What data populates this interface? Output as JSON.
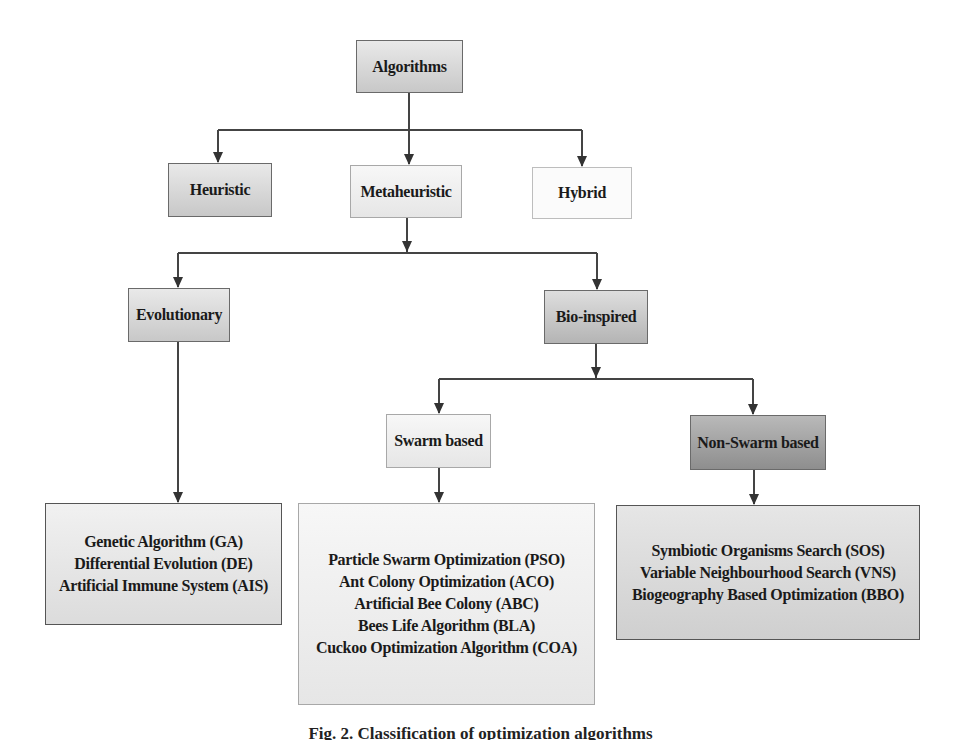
{
  "diagram": {
    "root": {
      "label": "Algorithms"
    },
    "level1": [
      {
        "label": "Heuristic"
      },
      {
        "label": "Metaheuristic"
      },
      {
        "label": "Hybrid"
      }
    ],
    "level2": [
      {
        "label": "Evolutionary"
      },
      {
        "label": "Bio-inspired"
      }
    ],
    "level3": [
      {
        "label": "Swarm based"
      },
      {
        "label": "Non-Swarm based"
      }
    ],
    "leaves": {
      "evolutionary": [
        "Genetic Algorithm (GA)",
        "Differential Evolution (DE)",
        "Artificial Immune System (AIS)"
      ],
      "swarm": [
        "Particle Swarm Optimization (PSO)",
        "Ant Colony Optimization (ACO)",
        "Artificial Bee Colony (ABC)",
        "Bees Life Algorithm (BLA)",
        "Cuckoo Optimization Algorithm (COA)"
      ],
      "non_swarm": [
        "Symbiotic Organisms Search (SOS)",
        "Variable Neighbourhood Search (VNS)",
        "Biogeography Based Optimization (BBO)"
      ]
    },
    "edges": [
      [
        "Algorithms",
        "Heuristic"
      ],
      [
        "Algorithms",
        "Metaheuristic"
      ],
      [
        "Algorithms",
        "Hybrid"
      ],
      [
        "Metaheuristic",
        "Evolutionary"
      ],
      [
        "Metaheuristic",
        "Bio-inspired"
      ],
      [
        "Bio-inspired",
        "Swarm based"
      ],
      [
        "Bio-inspired",
        "Non-Swarm based"
      ],
      [
        "Evolutionary",
        "evolutionary-leaves"
      ],
      [
        "Swarm based",
        "swarm-leaves"
      ],
      [
        "Non-Swarm based",
        "non-swarm-leaves"
      ]
    ]
  },
  "caption": "Fig. 2.  Classification of optimization algorithms"
}
